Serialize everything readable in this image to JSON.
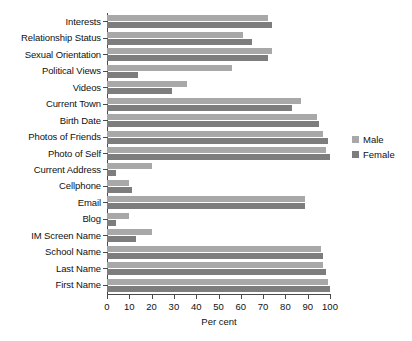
{
  "chart_data": {
    "type": "bar",
    "orientation": "horizontal",
    "title": "",
    "subtitle": "",
    "xlabel": "Per cent",
    "ylabel": "",
    "xlim": [
      0,
      100
    ],
    "xticks": [
      0,
      10,
      20,
      30,
      40,
      50,
      60,
      70,
      80,
      90,
      100
    ],
    "xtick_labels": [
      "0",
      "10",
      "20",
      "30",
      "40",
      "50",
      "60",
      "70",
      "80",
      "90",
      "100"
    ],
    "grid": false,
    "legend_position": "right",
    "categories": [
      "Interests",
      "Relationship Status",
      "Sexual Orientation",
      "Political Views",
      "Videos",
      "Current Town",
      "Birth Date",
      "Photos of Friends",
      "Photo of Self",
      "Current Address",
      "Cellphone",
      "Email",
      "Blog",
      "IM Screen Name",
      "School Name",
      "Last Name",
      "First Name"
    ],
    "series": [
      {
        "name": "Male",
        "color": "#a8a8a8",
        "values": [
          72,
          61,
          74,
          56,
          36,
          87,
          94,
          97,
          98,
          20,
          10,
          89,
          10,
          20,
          96,
          97,
          99
        ]
      },
      {
        "name": "Female",
        "color": "#7d7d7d",
        "values": [
          74,
          65,
          72,
          14,
          29,
          83,
          95,
          99,
          100,
          4,
          11,
          89,
          4,
          13,
          97,
          98,
          100
        ]
      }
    ]
  },
  "legend": {
    "items": [
      {
        "label": "Male"
      },
      {
        "label": "Female"
      }
    ]
  },
  "axis": {
    "x_title": "Per cent"
  },
  "colors": {
    "male": "#a8a8a8",
    "female": "#7d7d7d",
    "axis": "#4a4a4a",
    "text": "#111111",
    "background": "#ffffff"
  }
}
